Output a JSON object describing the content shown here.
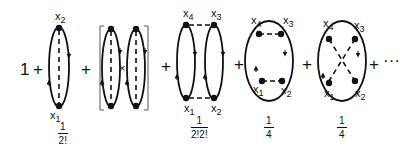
{
  "expansion": {
    "leading_term": "1",
    "plus": "+",
    "times": "×",
    "ellipsis": "···",
    "terms": [
      {
        "id": "single-loop",
        "labels": {
          "top": "x",
          "top_sub": "2",
          "bottom": "x",
          "bottom_sub": "1"
        },
        "weight": {
          "num": "1",
          "den": "2!"
        }
      },
      {
        "id": "bracket-product",
        "description": "[loop × loop]"
      },
      {
        "id": "two-loops-connected",
        "labels": {
          "tl": "x",
          "tl_sub": "4",
          "tr": "x",
          "tr_sub": "3",
          "bl": "x",
          "bl_sub": "1",
          "br": "x",
          "br_sub": "2"
        },
        "weight": {
          "num": "1",
          "den": "2!2!"
        }
      },
      {
        "id": "ring-parallel",
        "labels": {
          "tl": "x",
          "tl_sub": "4",
          "tr": "x",
          "tr_sub": "3",
          "bl": "x",
          "bl_sub": "1",
          "br": "x",
          "br_sub": "2"
        },
        "weight": {
          "num": "1",
          "den": "4"
        }
      },
      {
        "id": "ring-crossed",
        "labels": {
          "tl": "x",
          "tl_sub": "4",
          "tr": "x",
          "tr_sub": "3",
          "bl": "x",
          "bl_sub": "1",
          "br": "x",
          "br_sub": "2"
        },
        "weight": {
          "num": "1",
          "den": "4"
        }
      }
    ]
  }
}
